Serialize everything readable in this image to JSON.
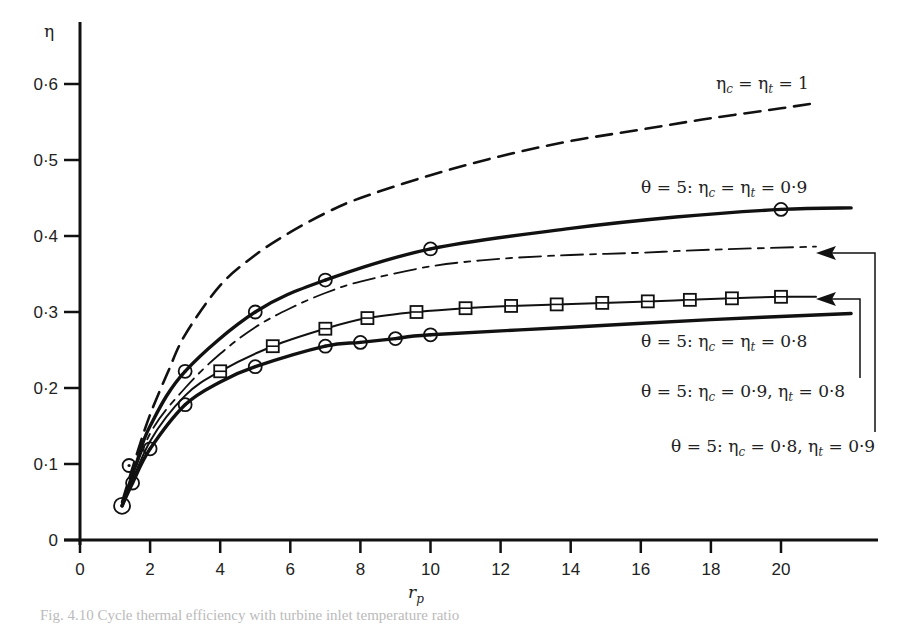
{
  "chart_data": {
    "type": "line",
    "title": "",
    "xlabel": "r_p",
    "ylabel": "η",
    "xlim": [
      0,
      22
    ],
    "ylim": [
      0,
      0.65
    ],
    "x_ticks": [
      "0",
      "2",
      "4",
      "6",
      "8",
      "10",
      "12",
      "14",
      "16",
      "18",
      "20"
    ],
    "y_ticks": [
      "0",
      "0·1",
      "0·2",
      "0·3",
      "0·4",
      "0·5",
      "0·6"
    ],
    "grid": false,
    "legend_position": "inline annotations at right",
    "series": [
      {
        "name": "ηc = ηt = 1",
        "style": "long-dash",
        "marker": "none",
        "points": [
          [
            1.2,
            0.05
          ],
          [
            1.6,
            0.11
          ],
          [
            2,
            0.165
          ],
          [
            2.5,
            0.22
          ],
          [
            3,
            0.27
          ],
          [
            4,
            0.335
          ],
          [
            5,
            0.375
          ],
          [
            6,
            0.405
          ],
          [
            7,
            0.43
          ],
          [
            8,
            0.45
          ],
          [
            10,
            0.48
          ],
          [
            12,
            0.505
          ],
          [
            14,
            0.525
          ],
          [
            16,
            0.54
          ],
          [
            18,
            0.555
          ],
          [
            20,
            0.568
          ],
          [
            21,
            0.575
          ]
        ]
      },
      {
        "name": "θ = 5: ηc = ηt = 0·9",
        "style": "thick-solid",
        "marker": "circle",
        "points": [
          [
            1.2,
            0.045
          ],
          [
            1.6,
            0.1
          ],
          [
            2,
            0.15
          ],
          [
            3,
            0.222
          ],
          [
            5,
            0.3
          ],
          [
            7,
            0.342
          ],
          [
            10,
            0.383
          ],
          [
            14,
            0.41
          ],
          [
            17,
            0.425
          ],
          [
            20,
            0.435
          ],
          [
            22,
            0.437
          ]
        ],
        "marker_points": [
          [
            3,
            0.222
          ],
          [
            5,
            0.3
          ],
          [
            7,
            0.342
          ],
          [
            10,
            0.383
          ],
          [
            20,
            0.435
          ]
        ]
      },
      {
        "name": "θ = 5: ηc = 0·8, ηt = 0·9",
        "style": "dash-dot",
        "marker": "none",
        "points": [
          [
            1.2,
            0.045
          ],
          [
            2,
            0.14
          ],
          [
            3,
            0.2
          ],
          [
            4,
            0.245
          ],
          [
            5,
            0.28
          ],
          [
            6,
            0.305
          ],
          [
            7,
            0.325
          ],
          [
            8,
            0.34
          ],
          [
            10,
            0.36
          ],
          [
            12,
            0.37
          ],
          [
            14,
            0.375
          ],
          [
            16,
            0.378
          ],
          [
            18,
            0.382
          ],
          [
            21,
            0.386
          ]
        ]
      },
      {
        "name": "θ = 5: ηc = 0·9, ηt = 0·8",
        "style": "thin-solid",
        "marker": "square",
        "points": [
          [
            1.2,
            0.045
          ],
          [
            2,
            0.13
          ],
          [
            3,
            0.19
          ],
          [
            4,
            0.222
          ],
          [
            5.5,
            0.255
          ],
          [
            7,
            0.278
          ],
          [
            8.2,
            0.292
          ],
          [
            9.6,
            0.3
          ],
          [
            11,
            0.305
          ],
          [
            12.3,
            0.308
          ],
          [
            13.6,
            0.31
          ],
          [
            14.9,
            0.312
          ],
          [
            16.2,
            0.314
          ],
          [
            17.4,
            0.316
          ],
          [
            18.6,
            0.318
          ],
          [
            20,
            0.32
          ],
          [
            21,
            0.32
          ]
        ],
        "marker_points": [
          [
            4,
            0.222
          ],
          [
            5.5,
            0.255
          ],
          [
            7,
            0.278
          ],
          [
            8.2,
            0.292
          ],
          [
            9.6,
            0.3
          ],
          [
            11,
            0.305
          ],
          [
            12.3,
            0.308
          ],
          [
            13.6,
            0.31
          ],
          [
            14.9,
            0.312
          ],
          [
            16.2,
            0.314
          ],
          [
            17.4,
            0.316
          ],
          [
            18.6,
            0.318
          ],
          [
            20,
            0.32
          ]
        ]
      },
      {
        "name": "θ = 5: ηc = ηt = 0·8",
        "style": "thick-solid",
        "marker": "circle",
        "points": [
          [
            1.2,
            0.045
          ],
          [
            1.5,
            0.075
          ],
          [
            2,
            0.12
          ],
          [
            3,
            0.178
          ],
          [
            4,
            0.208
          ],
          [
            5,
            0.228
          ],
          [
            7,
            0.255
          ],
          [
            8,
            0.26
          ],
          [
            9,
            0.265
          ],
          [
            10,
            0.27
          ],
          [
            14,
            0.28
          ],
          [
            18,
            0.29
          ],
          [
            22,
            0.298
          ]
        ],
        "marker_points": [
          [
            1.2,
            0.045
          ],
          [
            1.4,
            0.098
          ],
          [
            1.5,
            0.075
          ],
          [
            2,
            0.12
          ],
          [
            3,
            0.178
          ],
          [
            5,
            0.228
          ],
          [
            7,
            0.255
          ],
          [
            8,
            0.26
          ],
          [
            9,
            0.265
          ],
          [
            10,
            0.27
          ]
        ]
      }
    ],
    "annotations": [
      {
        "text": "ηc = ηt = 1"
      },
      {
        "text": "θ = 5: ηc = ηt = 0·9"
      },
      {
        "text": "θ = 5: ηc = ηt = 0·8"
      },
      {
        "text": "θ = 5: ηc = 0·9, ηt = 0·8",
        "arrow_to": "square-marker curve end"
      },
      {
        "text": "θ = 5: ηc = 0·8, ηt = 0·9",
        "arrow_to": "dash-dot curve end"
      }
    ]
  },
  "axes": {
    "y_label": "η",
    "x_label_main": "r",
    "x_label_sub": "p",
    "y_ticks": [
      {
        "label": "0",
        "v": 0
      },
      {
        "label": "0·1",
        "v": 0.1
      },
      {
        "label": "0·2",
        "v": 0.2
      },
      {
        "label": "0·3",
        "v": 0.3
      },
      {
        "label": "0·4",
        "v": 0.4
      },
      {
        "label": "0·5",
        "v": 0.5
      },
      {
        "label": "0·6",
        "v": 0.6
      }
    ],
    "x_ticks": [
      {
        "label": "0",
        "v": 0
      },
      {
        "label": "2",
        "v": 2
      },
      {
        "label": "4",
        "v": 4
      },
      {
        "label": "6",
        "v": 6
      },
      {
        "label": "8",
        "v": 8
      },
      {
        "label": "10",
        "v": 10
      },
      {
        "label": "12",
        "v": 12
      },
      {
        "label": "14",
        "v": 14
      },
      {
        "label": "16",
        "v": 16
      },
      {
        "label": "18",
        "v": 18
      },
      {
        "label": "20",
        "v": 20
      }
    ]
  },
  "labels": {
    "ideal": {
      "eta": "η",
      "c": "c",
      "eq1": " = ",
      "t": "t",
      "eq2": " = 1"
    },
    "l09": {
      "prefix": "θ = 5: η",
      "c": "c",
      "mid": " = η",
      "t": "t",
      "suffix": " = 0·9"
    },
    "l08": {
      "prefix": "θ = 5: η",
      "c": "c",
      "mid": " = η",
      "t": "t",
      "suffix": " = 0·8"
    },
    "lc09t08": {
      "prefix": "θ = 5: η",
      "c": "c",
      "mid": " = 0·9, η",
      "t": "t",
      "suffix": " = 0·8"
    },
    "lc08t09": {
      "prefix": "θ = 5: η",
      "c": "c",
      "mid": " = 0·8, η",
      "t": "t",
      "suffix": " = 0·9"
    }
  },
  "caption": "Fig. 4.10  Cycle thermal efficiency with turbine inlet temperature ratio"
}
